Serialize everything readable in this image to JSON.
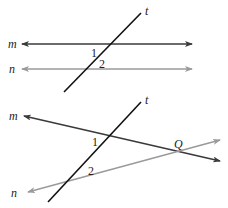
{
  "colors": {
    "dark_line": "#3a3a3a",
    "light_line": "#9a9a9a",
    "transversal": "#111111",
    "text": "#222222",
    "background": "#ffffff"
  },
  "figures": [
    {
      "name": "parallel-lines-figure",
      "lines": {
        "m": {
          "label": "m"
        },
        "n": {
          "label": "n"
        },
        "t": {
          "label": "t"
        }
      },
      "angles": [
        "1",
        "2"
      ]
    },
    {
      "name": "intersecting-lines-figure",
      "lines": {
        "m": {
          "label": "m"
        },
        "n": {
          "label": "n"
        },
        "t": {
          "label": "t"
        }
      },
      "angles": [
        "1",
        "2"
      ],
      "point": "Q"
    }
  ]
}
